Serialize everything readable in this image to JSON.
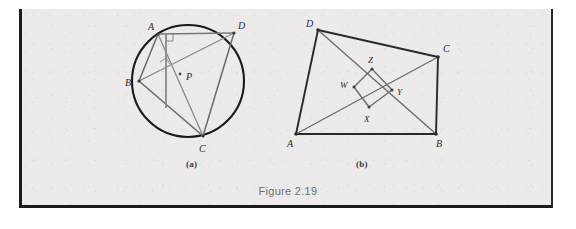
{
  "page": {
    "background_color": "#eceaea",
    "border_color": "#1c1c1c",
    "caption": "Figure 2.19"
  },
  "figures": [
    {
      "id": "a",
      "sub_label": "(a)",
      "type": "circle-cyclic-quadrilateral",
      "description": "Cyclic quadrilateral ABCD inscribed in a circle with diagonals AC and BD meeting at P, plus a perpendicular segment from A through P to side BC; two right-angle marks shown.",
      "circle": {
        "cx": 188,
        "cy": 81,
        "r": 56,
        "stroke": "#1a1a1a",
        "stroke_width": 2
      },
      "vertices": [
        {
          "name": "A",
          "x": 158,
          "y": 34,
          "label_x": 148,
          "label_y": 29
        },
        {
          "name": "B",
          "x": 139,
          "y": 81,
          "label_x": 126,
          "label_y": 85
        },
        {
          "name": "C",
          "x": 203,
          "y": 136,
          "label_x": 200,
          "label_y": 151
        },
        {
          "name": "D",
          "x": 234,
          "y": 33,
          "label_x": 238,
          "label_y": 28
        },
        {
          "name": "P",
          "x": 180,
          "y": 74,
          "label_x": 186,
          "label_y": 79
        }
      ],
      "segments": [
        {
          "from": "A",
          "to": "D"
        },
        {
          "from": "A",
          "to": "B"
        },
        {
          "from": "A",
          "to": "C"
        },
        {
          "from": "B",
          "to": "D"
        },
        {
          "from": "B",
          "to": "C"
        },
        {
          "from": "C",
          "to": "D"
        },
        {
          "from": "A",
          "to": "foot-on-BC"
        }
      ],
      "foot_on_bc": {
        "x": 172,
        "y": 108
      },
      "right_angle_marks": [
        {
          "at": "A-vertical-and-AD",
          "x": 165,
          "y": 40
        },
        {
          "at": "P-on-BD",
          "x": 167,
          "y": 64
        }
      ],
      "line_color": "#6d6d6d",
      "chord_color": "#5a5a5a"
    },
    {
      "id": "b",
      "sub_label": "(b)",
      "type": "quadrilateral-with-inner-quadrilateral",
      "description": "Quadrilateral ABCD with diagonals AC and BD; inner quadrilateral W Z Y X formed between them.",
      "vertices": [
        {
          "name": "A",
          "x": 296,
          "y": 134,
          "label_x": 288,
          "label_y": 146
        },
        {
          "name": "B",
          "x": 436,
          "y": 134,
          "label_x": 437,
          "label_y": 146
        },
        {
          "name": "C",
          "x": 438,
          "y": 57,
          "label_x": 442,
          "label_y": 51
        },
        {
          "name": "D",
          "x": 318,
          "y": 30,
          "label_x": 307,
          "label_y": 26
        },
        {
          "name": "W",
          "x": 354,
          "y": 87,
          "label_x": 342,
          "label_y": 86
        },
        {
          "name": "X",
          "x": 369,
          "y": 107,
          "label_x": 366,
          "label_y": 120
        },
        {
          "name": "Y",
          "x": 392,
          "y": 90,
          "label_x": 397,
          "label_y": 94
        },
        {
          "name": "Z",
          "x": 372,
          "y": 69,
          "label_x": 369,
          "label_y": 62
        }
      ],
      "segments": [
        {
          "from": "A",
          "to": "B"
        },
        {
          "from": "B",
          "to": "C"
        },
        {
          "from": "C",
          "to": "D"
        },
        {
          "from": "D",
          "to": "A"
        },
        {
          "from": "A",
          "to": "C"
        },
        {
          "from": "B",
          "to": "D"
        },
        {
          "from": "W",
          "to": "Z"
        },
        {
          "from": "Z",
          "to": "Y"
        },
        {
          "from": "Y",
          "to": "X"
        },
        {
          "from": "X",
          "to": "W"
        }
      ],
      "line_color": "#2a2a2a",
      "inner_color": "#6d6d6d"
    }
  ]
}
